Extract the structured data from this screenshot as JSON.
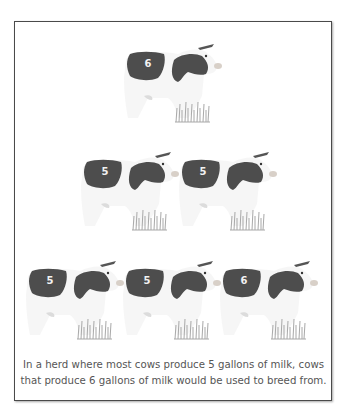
{
  "figure": {
    "caption_lines": [
      "In a herd where most cows produce 5 gallons of milk, cows",
      "that produce 6 gallons of milk would be used to breed from."
    ],
    "rows": [
      {
        "cows": [
          {
            "label": "6"
          }
        ]
      },
      {
        "cows": [
          {
            "label": "5"
          },
          {
            "label": "5"
          }
        ]
      },
      {
        "cows": [
          {
            "label": "5"
          },
          {
            "label": "5"
          },
          {
            "label": "6"
          }
        ]
      }
    ],
    "colors": {
      "patch": "#4d4d4d",
      "frame": "#4a4a4a",
      "grass": "#a8a8a8",
      "text": "#555555"
    }
  }
}
